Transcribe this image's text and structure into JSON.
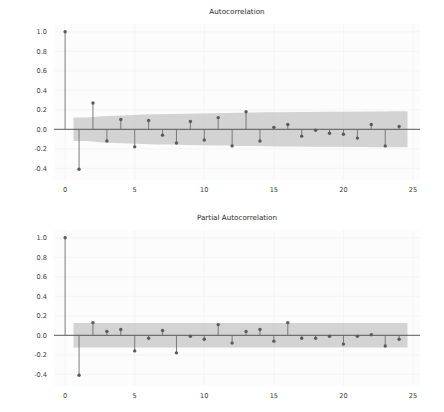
{
  "figure": {
    "width": 444,
    "height": 412,
    "background": "#ffffff",
    "panels": [
      "acf",
      "pacf"
    ]
  },
  "colors": {
    "marker": "#5a5a5a",
    "stem": "#6e6e6e",
    "confidence_band": "#b9b9b9",
    "zero_line": "#4a4a4a",
    "grid": "#f2f2f2",
    "plot_background": "#fcfcfc",
    "text": "#2a2a2a"
  },
  "chart_data": [
    {
      "type": "stem",
      "id": "acf",
      "title": "Autocorrelation",
      "xlabel": "",
      "ylabel": "",
      "xlim": [
        -0.8,
        25.5
      ],
      "ylim": [
        -0.52,
        1.08
      ],
      "xticks": [
        0,
        5,
        10,
        15,
        20,
        25
      ],
      "xticklabels": [
        "0",
        "5",
        "10",
        "15",
        "20",
        "25"
      ],
      "yticks": [
        -0.4,
        -0.2,
        0.0,
        0.2,
        0.4,
        0.6,
        0.8,
        1.0
      ],
      "yticklabels": [
        "-0.4",
        "-0.2",
        "0.0",
        "0.2",
        "0.4",
        "0.6",
        "0.8",
        "1.0"
      ],
      "grid": true,
      "legend": "none",
      "x": [
        0,
        1,
        2,
        3,
        4,
        5,
        6,
        7,
        8,
        9,
        10,
        11,
        12,
        13,
        14,
        15,
        16,
        17,
        18,
        19,
        20,
        21,
        22,
        23,
        24
      ],
      "values": [
        1.0,
        -0.41,
        0.27,
        -0.12,
        0.1,
        -0.18,
        0.09,
        -0.06,
        -0.14,
        0.08,
        -0.11,
        0.12,
        -0.17,
        0.18,
        -0.12,
        0.02,
        0.05,
        -0.07,
        -0.01,
        -0.04,
        -0.05,
        -0.09,
        0.05,
        -0.17,
        0.03
      ],
      "confidence_band": {
        "label": "95% confidence interval",
        "lower": [
          -0.12,
          -0.12,
          -0.135,
          -0.14,
          -0.145,
          -0.152,
          -0.155,
          -0.157,
          -0.16,
          -0.163,
          -0.165,
          -0.167,
          -0.17,
          -0.172,
          -0.174,
          -0.176,
          -0.177,
          -0.178,
          -0.179,
          -0.18,
          -0.181,
          -0.182,
          -0.183,
          -0.184,
          -0.185
        ],
        "upper": [
          0.12,
          0.12,
          0.135,
          0.14,
          0.145,
          0.152,
          0.155,
          0.157,
          0.16,
          0.163,
          0.165,
          0.167,
          0.17,
          0.172,
          0.174,
          0.176,
          0.177,
          0.178,
          0.179,
          0.18,
          0.181,
          0.182,
          0.183,
          0.184,
          0.185
        ],
        "start_lag": 0.6,
        "end_lag": 24.6
      }
    },
    {
      "type": "stem",
      "id": "pacf",
      "title": "Partial Autocorrelation",
      "xlabel": "",
      "ylabel": "",
      "xlim": [
        -0.8,
        25.5
      ],
      "ylim": [
        -0.52,
        1.08
      ],
      "xticks": [
        0,
        5,
        10,
        15,
        20,
        25
      ],
      "xticklabels": [
        "0",
        "5",
        "10",
        "15",
        "20",
        "25"
      ],
      "yticks": [
        -0.4,
        -0.2,
        0.0,
        0.2,
        0.4,
        0.6,
        0.8,
        1.0
      ],
      "yticklabels": [
        "-0.4",
        "-0.2",
        "0.0",
        "0.2",
        "0.4",
        "0.6",
        "0.8",
        "1.0"
      ],
      "grid": true,
      "legend": "none",
      "x": [
        0,
        1,
        2,
        3,
        4,
        5,
        6,
        7,
        8,
        9,
        10,
        11,
        12,
        13,
        14,
        15,
        16,
        17,
        18,
        19,
        20,
        21,
        22,
        23,
        24
      ],
      "values": [
        1.0,
        -0.41,
        0.13,
        0.04,
        0.06,
        -0.16,
        -0.03,
        0.05,
        -0.18,
        -0.01,
        -0.04,
        0.11,
        -0.08,
        0.04,
        0.06,
        -0.06,
        0.13,
        -0.03,
        -0.03,
        -0.01,
        -0.09,
        -0.01,
        0.005,
        -0.11,
        -0.04
      ],
      "confidence_band": {
        "label": "95% confidence interval",
        "lower": [
          -0.125,
          -0.125,
          -0.125,
          -0.125,
          -0.125,
          -0.125,
          -0.125,
          -0.125,
          -0.125,
          -0.125,
          -0.125,
          -0.125,
          -0.125,
          -0.125,
          -0.125,
          -0.125,
          -0.125,
          -0.125,
          -0.125,
          -0.125,
          -0.125,
          -0.125,
          -0.125,
          -0.125,
          -0.125
        ],
        "upper": [
          0.125,
          0.125,
          0.125,
          0.125,
          0.125,
          0.125,
          0.125,
          0.125,
          0.125,
          0.125,
          0.125,
          0.125,
          0.125,
          0.125,
          0.125,
          0.125,
          0.125,
          0.125,
          0.125,
          0.125,
          0.125,
          0.125,
          0.125,
          0.125,
          0.125
        ],
        "start_lag": 0.6,
        "end_lag": 24.6
      }
    }
  ]
}
